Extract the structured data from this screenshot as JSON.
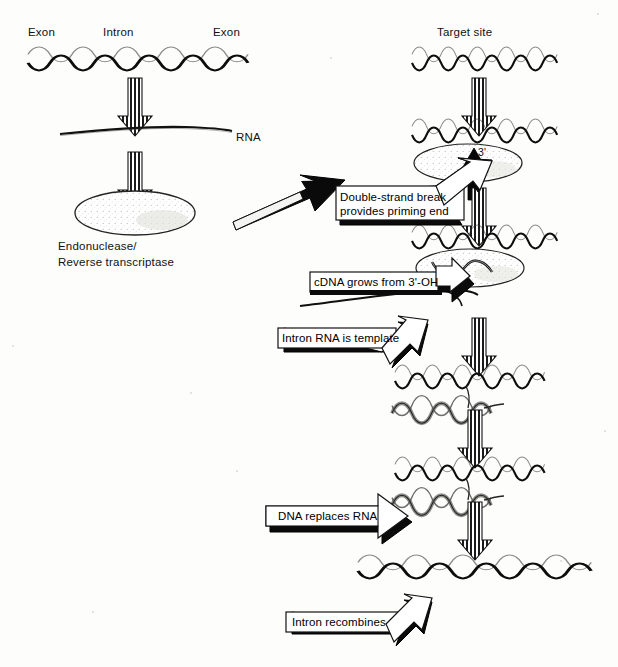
{
  "figure": {
    "background_color": "#fdfdfc",
    "ink_color": "#000000",
    "width": 618,
    "height": 667
  },
  "labels": {
    "exon_left": "Exon",
    "intron": "Intron",
    "exon_right": "Exon",
    "rna": "RNA",
    "enzyme": "Endonuclease/\nReverse  transcriptase",
    "enzyme_line1": "Endonuclease/",
    "enzyme_line2": "Reverse  transcriptase",
    "target_site": "Target site",
    "three_prime": "3'"
  },
  "callouts": [
    {
      "id": "double-strand-break",
      "text": "Double-strand break\nprovides priming end",
      "line1": "Double-strand break",
      "line2": "provides priming end",
      "direction": "up-right"
    },
    {
      "id": "cdna-grows",
      "text": "cDNA grows from 3'-OH",
      "line1": "cDNA grows from 3'-OH",
      "direction": "right-down"
    },
    {
      "id": "intron-rna-template",
      "text": "Intron RNA is template",
      "line1": "Intron RNA is template",
      "direction": "up-right"
    },
    {
      "id": "dna-replaces-rna",
      "text": "DNA replaces RNA",
      "line1": "DNA replaces RNA",
      "direction": "right"
    },
    {
      "id": "intron-recombines",
      "text": "Intron recombines",
      "line1": "Intron recombines",
      "direction": "up-right"
    }
  ],
  "steps": {
    "left_column": [
      "Genomic DNA with Exon-Intron-Exon",
      "RNA transcript",
      "Endonuclease / Reverse transcriptase protein"
    ],
    "right_column": [
      "Target site DNA duplex",
      "Cleaved duplex with enzyme and 3' priming end",
      "cDNA synthesis on intron RNA template",
      "RNA-DNA hybrid strand",
      "DNA replaces RNA",
      "Recombined DNA duplex with intron"
    ]
  },
  "arrows": {
    "vertical_count": 8,
    "style": "striped-block-down-arrow",
    "diagonal_connector": "solid-black-up-right-arrow"
  }
}
